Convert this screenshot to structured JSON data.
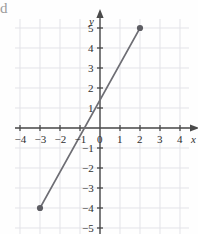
{
  "figure": {
    "corner_glyph": "d",
    "background_color": "#fefefe",
    "grid_color": "#e3e3e8",
    "axis_color": "#4a4a4a",
    "line_color": "#6e6e74",
    "point_color": "#5d5d63",
    "label_color": "#2e2e2e"
  },
  "chart_data": {
    "type": "line",
    "title": "",
    "xlabel": "x",
    "ylabel": "y",
    "xlim": [
      -4.6,
      4.8
    ],
    "ylim": [
      -5.4,
      5.6
    ],
    "grid": true,
    "grid_step": 1,
    "legend": "none",
    "xticks": [
      -4,
      -3,
      -2,
      -1,
      0,
      1,
      2,
      3,
      4
    ],
    "xtick_labels": [
      "-4",
      "-3",
      "-2",
      "-1",
      "0",
      "1",
      "2",
      "3",
      "4"
    ],
    "yticks": [
      -5,
      -4,
      -3,
      -2,
      -1,
      1,
      2,
      3,
      4,
      5
    ],
    "ytick_labels": [
      "-5",
      "-4",
      "-3",
      "-2",
      "-1",
      "1",
      "2",
      "3",
      "4",
      "5"
    ],
    "origin_label": "0",
    "axis_arrows": [
      "x-positive",
      "y-positive"
    ],
    "series": [
      {
        "name": "segment",
        "type": "line-segment",
        "x": [
          -3,
          2
        ],
        "y": [
          -4,
          5
        ],
        "endpoints_marked": true,
        "slope": 1.8,
        "y_intercept": 1.4,
        "x_intercept": -0.78
      }
    ],
    "annotations": []
  }
}
